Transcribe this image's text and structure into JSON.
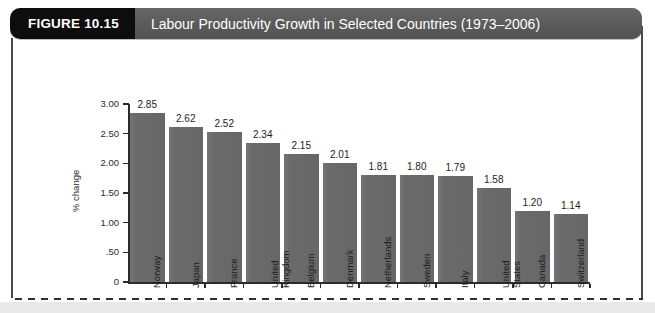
{
  "figure": {
    "tag": "FIGURE 10.15",
    "title": "Labour Productivity Growth in Selected Countries (1973–2006)"
  },
  "colors": {
    "tag_background": "#0d0d0d",
    "title_background": "#5b5b5b",
    "title_text": "#ffffff",
    "bar_fill": "#6b6b6b",
    "axis": "#2b2b2b",
    "page_background": "#ffffff",
    "bottom_band": "#e9e9e9"
  },
  "chart_data": {
    "type": "bar",
    "title": "Labour Productivity Growth in Selected Countries (1973–2006)",
    "xlabel": "",
    "ylabel": "% change",
    "ylim": [
      0,
      3.0
    ],
    "yticks": [
      0,
      0.5,
      1.0,
      1.5,
      2.0,
      2.5,
      3.0
    ],
    "ytick_labels": [
      "0",
      ".50",
      "1.00",
      "1.50",
      "2.00",
      "2.50",
      "3.00"
    ],
    "grid": false,
    "legend": false,
    "categories": [
      "Norway",
      "Japan",
      "France",
      "United Kingdom",
      "Belgium",
      "Denmark",
      "Netherlands",
      "Sweden",
      "Italy",
      "United States",
      "Canada",
      "Switzerland"
    ],
    "category_lines": [
      [
        "Norway"
      ],
      [
        "Japan"
      ],
      [
        "France"
      ],
      [
        "United",
        "Kingdom"
      ],
      [
        "Belgium"
      ],
      [
        "Denmark"
      ],
      [
        "Netherlands"
      ],
      [
        "Sweden"
      ],
      [
        "Italy"
      ],
      [
        "United",
        "States"
      ],
      [
        "Canada"
      ],
      [
        "Switzerland"
      ]
    ],
    "values": [
      2.85,
      2.62,
      2.52,
      2.34,
      2.15,
      2.01,
      1.81,
      1.8,
      1.79,
      1.58,
      1.2,
      1.14
    ],
    "value_labels": [
      "2.85",
      "2.62",
      "2.52",
      "2.34",
      "2.15",
      "2.01",
      "1.81",
      "1.80",
      "1.79",
      "1.58",
      "1.20",
      "1.14"
    ]
  }
}
